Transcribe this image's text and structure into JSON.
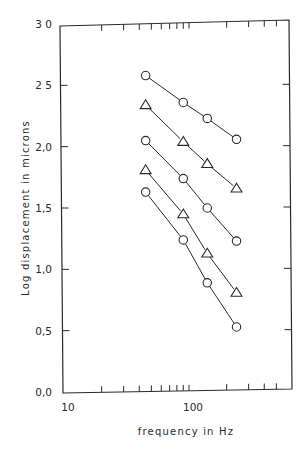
{
  "chart_data": {
    "type": "line",
    "title": "",
    "xlabel": "frequency  in  Hz",
    "ylabel": "Log  displacement  in  microns",
    "xscale": "log",
    "xlim": [
      10,
      650
    ],
    "ylim": [
      0.0,
      3.0
    ],
    "x_tick_labels": [
      "10",
      "100"
    ],
    "y_tick_labels": [
      "0,0",
      "0,5",
      "1,0",
      "1,5",
      "2,0",
      "2 5",
      "3 0"
    ],
    "y_ticks": [
      0.0,
      0.5,
      1.0,
      1.5,
      2.0,
      2.5,
      3.0
    ],
    "grid": false,
    "legend": null,
    "x": [
      45,
      90,
      140,
      240
    ],
    "series": [
      {
        "name": "series-1",
        "marker": "circle",
        "values": [
          2.58,
          2.36,
          2.23,
          2.06
        ]
      },
      {
        "name": "series-2",
        "marker": "triangle",
        "values": [
          2.34,
          2.04,
          1.86,
          1.66
        ]
      },
      {
        "name": "series-3",
        "marker": "circle",
        "values": [
          2.05,
          1.74,
          1.5,
          1.23
        ]
      },
      {
        "name": "series-4",
        "marker": "triangle",
        "values": [
          1.81,
          1.45,
          1.13,
          0.81
        ]
      },
      {
        "name": "series-5",
        "marker": "circle",
        "values": [
          1.63,
          1.24,
          0.89,
          0.53
        ]
      }
    ]
  },
  "colors": {
    "ink": "#2a2a2a",
    "background": "#ffffff"
  }
}
